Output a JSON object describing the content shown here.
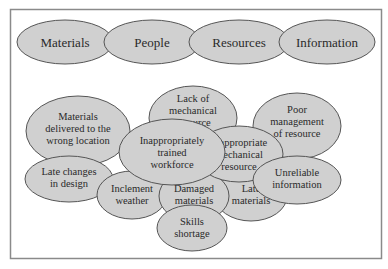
{
  "diagram": {
    "colors": {
      "fill": "#d0d0d0",
      "stroke": "#555555",
      "text": "#2a2a2a",
      "frame": "#8a8a8a"
    },
    "categories": [
      {
        "label": "Materials"
      },
      {
        "label": "People"
      },
      {
        "label": "Resources"
      },
      {
        "label": "Information"
      }
    ],
    "causes": [
      {
        "lines": [
          "Materials",
          "delivered to the",
          "wrong location"
        ]
      },
      {
        "lines": [
          "Lack of",
          "mechanical",
          "resource"
        ]
      },
      {
        "lines": [
          "Poor",
          "management",
          "of resource"
        ]
      },
      {
        "lines": [
          "Late changes",
          "in design"
        ]
      },
      {
        "lines": [
          "Inclement",
          "weather"
        ]
      },
      {
        "lines": [
          "Damaged",
          "materials"
        ]
      },
      {
        "lines": [
          "Late",
          "materials"
        ]
      },
      {
        "lines": [
          "Skills",
          "shortage"
        ]
      },
      {
        "lines": [
          "Inappropriate",
          "mechanical",
          "resource"
        ]
      },
      {
        "lines": [
          "Unreliable",
          "information"
        ]
      },
      {
        "lines": [
          "Inappropriately",
          "trained",
          "workforce"
        ]
      }
    ]
  }
}
